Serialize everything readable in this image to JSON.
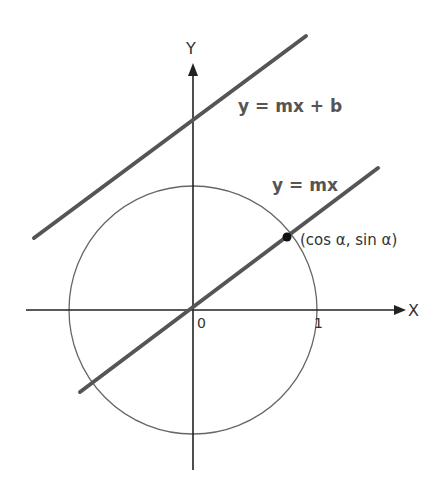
{
  "figure": {
    "labels": {
      "y_axis": "Y",
      "x_axis": "X",
      "origin": "0",
      "unit_tick": "1",
      "line_through_origin": "y = mx",
      "line_offset": "y = mx + b",
      "point": "(cos α, sin α)"
    },
    "colors": {
      "background": "#ffffff",
      "axes": "#222222",
      "lines": "#555555",
      "circle": "#666666",
      "point": "#111111"
    },
    "geometry": {
      "origin_px": [
        193,
        310
      ],
      "unit_circle_radius_px": 124,
      "point_px": [
        287,
        237
      ]
    }
  }
}
